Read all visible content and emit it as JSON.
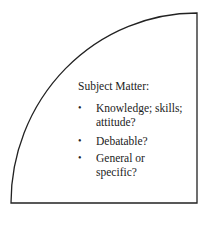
{
  "diagram": {
    "shape": "quarter-circle",
    "stroke_color": "#222222",
    "title": "Subject Matter:",
    "items": [
      {
        "lines": [
          "Knowledge; skills;",
          "attitude?"
        ]
      },
      {
        "lines": [
          "Debatable?"
        ]
      },
      {
        "lines": [
          "General or",
          "specific?"
        ]
      }
    ],
    "bullet_glyph": "•"
  }
}
